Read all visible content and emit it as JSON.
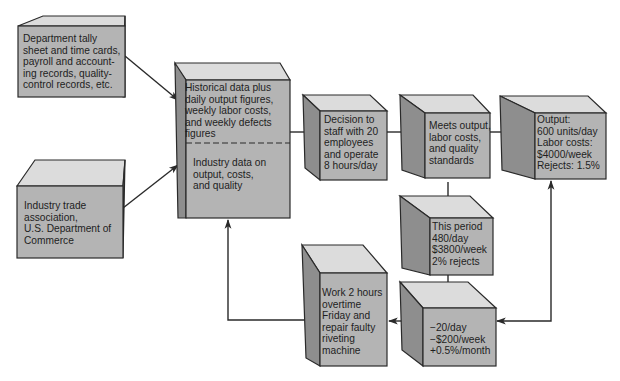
{
  "colors": {
    "front": "#b4b4b4",
    "side": "#8e8e8e",
    "top": "#dcdcdc",
    "stroke": "#2a2a2a",
    "text": "#1e1e1e",
    "background": "#ffffff"
  },
  "nodes": [
    {
      "id": "dept-records",
      "text": "Department tally\nsheet and time cards,\npayroll and account-\ning records, quality-\ncontrol records, etc."
    },
    {
      "id": "industry-trade",
      "text": "Industry trade\nassociation,\nU.S. Department of\nCommerce"
    },
    {
      "id": "historical-data",
      "text": "Historical data plus\ndaily output figures,\nweekly labor costs,\nand weekly defects\nfigures"
    },
    {
      "id": "industry-data",
      "text": "Industry data on\noutput, costs,\nand quality"
    },
    {
      "id": "decision",
      "text": "Decision to\nstaff with 20\nemployees\nand operate\n8 hours/day"
    },
    {
      "id": "meets-standards",
      "text": "Meets output,\nlabor costs,\nand quality\nstandards"
    },
    {
      "id": "output-standards",
      "text": "Output:\n600 units/day\nLabor costs:\n$4000/week\nRejects: 1.5%"
    },
    {
      "id": "this-period",
      "text": "This period\n480/day\n$3800/week\n2% rejects"
    },
    {
      "id": "deviation",
      "text": "−20/day\n−$200/week\n+0.5%/month"
    },
    {
      "id": "corrective-action",
      "text": "Work 2 hours\novertime\nFriday and\nrepair faulty\nriveting\nmachine"
    }
  ],
  "edges": [
    {
      "from": "dept-records",
      "to": "historical-data"
    },
    {
      "from": "industry-trade",
      "to": "industry-data"
    },
    {
      "from": "historical-data",
      "to": "decision"
    },
    {
      "from": "decision",
      "to": "meets-standards"
    },
    {
      "from": "meets-standards",
      "to": "output-standards"
    },
    {
      "from": "meets-standards",
      "to": "this-period"
    },
    {
      "from": "this-period",
      "to": "deviation"
    },
    {
      "from": "output-standards",
      "to": "deviation",
      "bidirectional": true
    },
    {
      "from": "deviation",
      "to": "corrective-action"
    },
    {
      "from": "corrective-action",
      "to": "industry-data"
    }
  ]
}
